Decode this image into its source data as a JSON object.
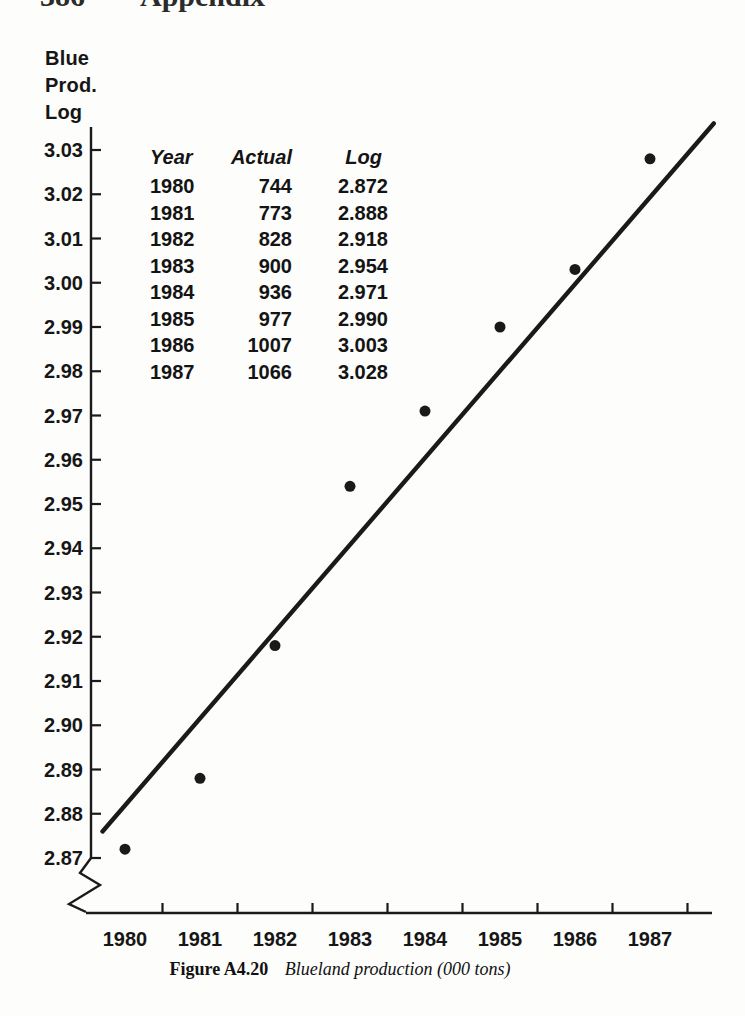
{
  "page": {
    "header": {
      "page_number": "386",
      "title": "Appendix"
    }
  },
  "chart_data": {
    "type": "scatter",
    "title": "",
    "ylabel_lines": [
      "Blue",
      "Prod.",
      "Log"
    ],
    "xlabel": "",
    "categories": [
      "1980",
      "1981",
      "1982",
      "1983",
      "1984",
      "1985",
      "1986",
      "1987"
    ],
    "series": [
      {
        "name": "Actual",
        "values": [
          744,
          773,
          828,
          900,
          936,
          977,
          1007,
          1066
        ]
      },
      {
        "name": "Log",
        "values": [
          2.872,
          2.888,
          2.918,
          2.954,
          2.971,
          2.99,
          3.003,
          3.028
        ]
      }
    ],
    "plotted_series": "Log",
    "ylim": [
      2.87,
      3.03
    ],
    "ytick_step": 0.01,
    "yticks": [
      "3.03",
      "3.02",
      "3.01",
      "3.00",
      "2.99",
      "2.98",
      "2.97",
      "2.96",
      "2.95",
      "2.94",
      "2.93",
      "2.92",
      "2.91",
      "2.90",
      "2.89",
      "2.88",
      "2.87"
    ],
    "trendline": {
      "start": {
        "year": 1979.7,
        "log": 2.876
      },
      "end": {
        "year": 1987.85,
        "log": 3.036
      }
    },
    "axis_break_bottom_left": true,
    "grid": false,
    "legend": null,
    "marker_color": "#1a1a1a",
    "line_color": "#1a1a1a"
  },
  "inset_table": {
    "headers": [
      "Year",
      "Actual",
      "Log"
    ],
    "rows": [
      [
        "1980",
        "744",
        "2.872"
      ],
      [
        "1981",
        "773",
        "2.888"
      ],
      [
        "1982",
        "828",
        "2.918"
      ],
      [
        "1983",
        "900",
        "2.954"
      ],
      [
        "1984",
        "936",
        "2.971"
      ],
      [
        "1985",
        "977",
        "2.990"
      ],
      [
        "1986",
        "1007",
        "3.003"
      ],
      [
        "1987",
        "1066",
        "3.028"
      ]
    ]
  },
  "caption": {
    "label": "Figure A4.20",
    "text": "Blueland production (000 tons)"
  }
}
